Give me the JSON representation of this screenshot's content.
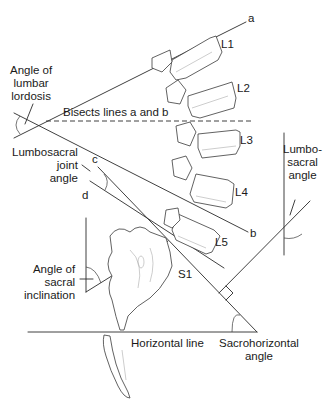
{
  "diagram": {
    "type": "anatomical-line-drawing"
  },
  "vertebrae": [
    {
      "id": "L1",
      "label": "L1"
    },
    {
      "id": "L2",
      "label": "L2"
    },
    {
      "id": "L3",
      "label": "L3"
    },
    {
      "id": "L4",
      "label": "L4"
    },
    {
      "id": "L5",
      "label": "L5"
    },
    {
      "id": "S1",
      "label": "S1"
    }
  ],
  "lines": {
    "a": "a",
    "b": "b",
    "c": "c",
    "d": "d"
  },
  "labels": {
    "lumbar_lordosis": "Angle of\nlumbar\nlordosis",
    "bisects": "Bisects lines a and b",
    "lumbosacral_joint": "Lumbosacral\njoint\nangle",
    "lumbosacral_angle": "Lumbo-\nsacral\nangle",
    "sacral_inclination": "Angle of\nsacral\ninclination",
    "horizontal_line": "Horizontal line",
    "sacrohorizontal": "Sacrohorizontal\nangle"
  }
}
